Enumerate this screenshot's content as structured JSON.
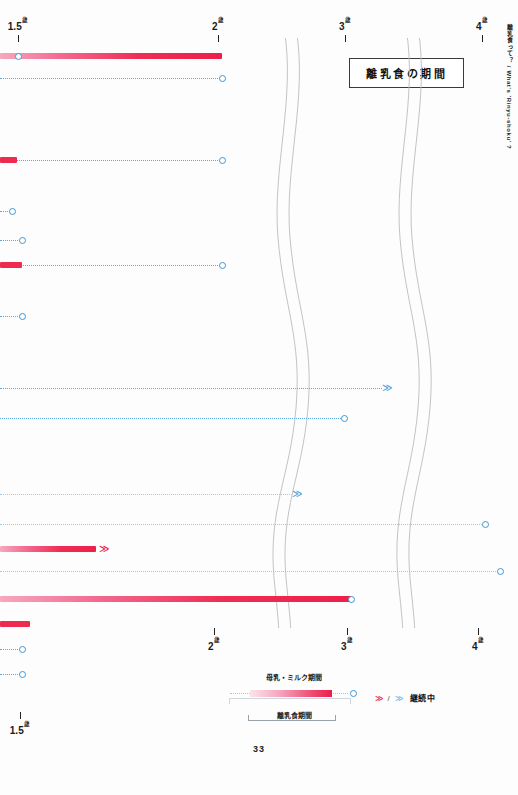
{
  "page": {
    "number": "33",
    "title": "離乳食の期間",
    "side_caption": "離乳食って？ / What's 'Rinyu-shoku' ?"
  },
  "axis": {
    "top": [
      {
        "num": "1.5",
        "unit": "歳",
        "x": 18
      },
      {
        "num": "2",
        "unit": "歳",
        "x": 218
      },
      {
        "num": "3",
        "unit": "歳",
        "x": 345
      },
      {
        "num": "4",
        "unit": "歳",
        "x": 482
      }
    ],
    "bottom": [
      {
        "num": "2",
        "unit": "歳",
        "x": 214
      },
      {
        "num": "3",
        "unit": "歳",
        "x": 347
      },
      {
        "num": "4",
        "unit": "歳",
        "x": 478
      },
      {
        "num": "1.5",
        "unit": "歳",
        "x": 20
      }
    ]
  },
  "colors": {
    "pink": "#ee2a4f",
    "pink_light": "#f5a8c0",
    "blue": "#3f96d2",
    "blue_dot": "#5aa9dd",
    "blue_faint": "#9ccbe8"
  },
  "legend": {
    "milk_label": "母乳・ミルク期間",
    "weaning_label": "離乳食期間",
    "cont_pink": "≫",
    "cont_slash": "/",
    "cont_blue": "≫",
    "cont_text": "継続中"
  },
  "chart_data": {
    "type": "bar",
    "title": "離乳食の期間",
    "xlabel": "年齢",
    "ylabel": "",
    "x_ticks": [
      "1.5歳",
      "2歳",
      "3歳",
      "4歳"
    ],
    "x_tick_px": [
      18,
      218,
      345,
      482
    ],
    "grid": false,
    "legend_position": "bottom",
    "note": "横棒＝個々の回答者の母乳・ミルク期間（青点線）と離乳食期間（ピンク実線）。〇＝終了、≫＝継続中。",
    "rows": [
      {
        "id": 1,
        "y": 12,
        "pink": {
          "x0": 0,
          "x1": 222,
          "style": "gradient"
        },
        "dot": null,
        "endpoint": 18,
        "chevron": null
      },
      {
        "id": 2,
        "y": 34,
        "pink": null,
        "dot": {
          "x0": 0,
          "x1": 222,
          "tone": "normal"
        },
        "endpoint": 222,
        "chevron": null
      },
      {
        "id": 3,
        "y": 116,
        "pink": {
          "x0": 0,
          "x1": 17,
          "style": "flat"
        },
        "dot": {
          "x0": 10,
          "x1": 222,
          "tone": "normal"
        },
        "endpoint": 222,
        "chevron": null
      },
      {
        "id": 4,
        "y": 167,
        "pink": null,
        "dot": {
          "x0": 0,
          "x1": 12,
          "tone": "normal"
        },
        "endpoint": 12,
        "chevron": null
      },
      {
        "id": 5,
        "y": 196,
        "pink": null,
        "dot": {
          "x0": 0,
          "x1": 22,
          "tone": "normal"
        },
        "endpoint": 22,
        "chevron": null
      },
      {
        "id": 6,
        "y": 221,
        "pink": {
          "x0": 0,
          "x1": 22,
          "style": "flat"
        },
        "dot": {
          "x0": 18,
          "x1": 222,
          "tone": "normal"
        },
        "endpoint": 222,
        "chevron": null
      },
      {
        "id": 7,
        "y": 272,
        "pink": null,
        "dot": {
          "x0": 0,
          "x1": 22,
          "tone": "normal"
        },
        "endpoint": 22,
        "chevron": null
      },
      {
        "id": 8,
        "y": 344,
        "pink": null,
        "dot": {
          "x0": 0,
          "x1": 382,
          "tone": "normal"
        },
        "endpoint": null,
        "chevron": {
          "x": 382,
          "tone": "blue"
        }
      },
      {
        "id": 9,
        "y": 374,
        "pink": null,
        "dot": {
          "x0": 0,
          "x1": 347,
          "tone": "normal"
        },
        "endpoint": 344,
        "chevron": null
      },
      {
        "id": 10,
        "y": 450,
        "pink": null,
        "dot": {
          "x0": 0,
          "x1": 292,
          "tone": "faint"
        },
        "endpoint": null,
        "chevron": {
          "x": 292,
          "tone": "blue"
        }
      },
      {
        "id": 11,
        "y": 480,
        "pink": null,
        "dot": {
          "x0": 0,
          "x1": 488,
          "tone": "faint"
        },
        "endpoint": 485,
        "chevron": null
      },
      {
        "id": 12,
        "y": 505,
        "pink": {
          "x0": 0,
          "x1": 96,
          "style": "gradient"
        },
        "dot": null,
        "endpoint": null,
        "chevron": {
          "x": 99,
          "tone": "pink"
        }
      },
      {
        "id": 13,
        "y": 527,
        "pink": null,
        "dot": {
          "x0": 0,
          "x1": 500,
          "tone": "faint"
        },
        "endpoint": 500,
        "chevron": null
      },
      {
        "id": 14,
        "y": 555,
        "pink": {
          "x0": 0,
          "x1": 352,
          "style": "gradient"
        },
        "dot": null,
        "endpoint": 351,
        "chevron": null
      },
      {
        "id": 15,
        "y": 580,
        "pink": {
          "x0": 0,
          "x1": 30,
          "style": "flat"
        },
        "dot": null,
        "endpoint": null,
        "chevron": null
      },
      {
        "id": 16,
        "y": 605,
        "pink": null,
        "dot": {
          "x0": 0,
          "x1": 22,
          "tone": "normal"
        },
        "endpoint": 22,
        "chevron": null
      },
      {
        "id": 17,
        "y": 630,
        "pink": null,
        "dot": {
          "x0": 0,
          "x1": 22,
          "tone": "normal"
        },
        "endpoint": 22,
        "chevron": null
      }
    ]
  }
}
